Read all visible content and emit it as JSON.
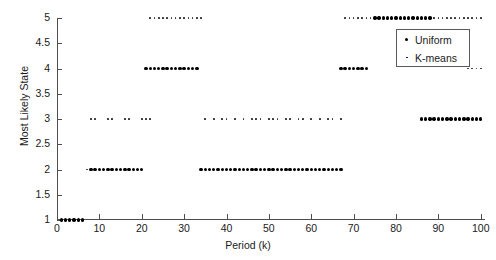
{
  "chart_data": {
    "type": "scatter",
    "title": "",
    "xlabel": "Period (k)",
    "ylabel": "Most Likely State",
    "xlim": [
      0,
      101
    ],
    "ylim": [
      1,
      5
    ],
    "xticks": [
      0,
      10,
      20,
      30,
      40,
      50,
      60,
      70,
      80,
      90,
      100
    ],
    "xtick_labels": [
      "0",
      "10",
      "20",
      "30",
      "40",
      "50",
      "60",
      "70",
      "80",
      "90",
      "100"
    ],
    "yticks": [
      1,
      1.5,
      2,
      2.5,
      3,
      3.5,
      4,
      4.5,
      5
    ],
    "ytick_labels": [
      "1",
      "1.5",
      "2",
      "2.5",
      "3",
      "3.5",
      "4",
      "4.5",
      "5"
    ],
    "grid": false,
    "legend_position": "upper right",
    "legend": [
      {
        "name": "Uniform",
        "marker": "large-dot",
        "color": "#000000"
      },
      {
        "name": "K-means",
        "marker": "small-dot",
        "color": "#2b2b2b"
      }
    ],
    "series": [
      {
        "name": "Uniform",
        "marker": "large-dot",
        "points": [
          [
            1,
            1
          ],
          [
            2,
            1
          ],
          [
            3,
            1
          ],
          [
            4,
            1
          ],
          [
            5,
            1
          ],
          [
            6,
            1
          ],
          [
            8,
            2
          ],
          [
            9,
            2
          ],
          [
            10,
            2
          ],
          [
            11,
            2
          ],
          [
            12,
            2
          ],
          [
            13,
            2
          ],
          [
            14,
            2
          ],
          [
            15,
            2
          ],
          [
            16,
            2
          ],
          [
            17,
            2
          ],
          [
            18,
            2
          ],
          [
            19,
            2
          ],
          [
            20,
            2
          ],
          [
            21,
            4
          ],
          [
            22,
            4
          ],
          [
            23,
            4
          ],
          [
            24,
            4
          ],
          [
            25,
            4
          ],
          [
            26,
            4
          ],
          [
            27,
            4
          ],
          [
            28,
            4
          ],
          [
            29,
            4
          ],
          [
            30,
            4
          ],
          [
            31,
            4
          ],
          [
            32,
            4
          ],
          [
            33,
            4
          ],
          [
            34,
            2
          ],
          [
            35,
            2
          ],
          [
            36,
            2
          ],
          [
            37,
            2
          ],
          [
            38,
            2
          ],
          [
            39,
            2
          ],
          [
            40,
            2
          ],
          [
            41,
            2
          ],
          [
            42,
            2
          ],
          [
            43,
            2
          ],
          [
            44,
            2
          ],
          [
            45,
            2
          ],
          [
            46,
            2
          ],
          [
            47,
            2
          ],
          [
            48,
            2
          ],
          [
            49,
            2
          ],
          [
            50,
            2
          ],
          [
            51,
            2
          ],
          [
            52,
            2
          ],
          [
            53,
            2
          ],
          [
            54,
            2
          ],
          [
            55,
            2
          ],
          [
            56,
            2
          ],
          [
            57,
            2
          ],
          [
            58,
            2
          ],
          [
            59,
            2
          ],
          [
            60,
            2
          ],
          [
            61,
            2
          ],
          [
            62,
            2
          ],
          [
            63,
            2
          ],
          [
            64,
            2
          ],
          [
            65,
            2
          ],
          [
            66,
            2
          ],
          [
            67,
            2
          ],
          [
            67,
            4
          ],
          [
            68,
            4
          ],
          [
            69,
            4
          ],
          [
            70,
            4
          ],
          [
            71,
            4
          ],
          [
            72,
            4
          ],
          [
            73,
            4
          ],
          [
            75,
            5
          ],
          [
            76,
            5
          ],
          [
            77,
            5
          ],
          [
            78,
            5
          ],
          [
            79,
            5
          ],
          [
            80,
            5
          ],
          [
            81,
            5
          ],
          [
            82,
            5
          ],
          [
            83,
            5
          ],
          [
            84,
            5
          ],
          [
            85,
            5
          ],
          [
            86,
            5
          ],
          [
            87,
            5
          ],
          [
            88,
            5
          ],
          [
            86,
            3
          ],
          [
            87,
            3
          ],
          [
            88,
            3
          ],
          [
            89,
            3
          ],
          [
            90,
            3
          ],
          [
            91,
            3
          ],
          [
            92,
            3
          ],
          [
            93,
            3
          ],
          [
            94,
            3
          ],
          [
            95,
            3
          ],
          [
            96,
            3
          ],
          [
            97,
            3
          ],
          [
            98,
            3
          ],
          [
            99,
            3
          ],
          [
            100,
            3
          ]
        ]
      },
      {
        "name": "K-means",
        "marker": "small-dot",
        "points": [
          [
            7,
            2
          ],
          [
            8,
            3
          ],
          [
            9,
            3
          ],
          [
            12,
            3
          ],
          [
            13,
            3
          ],
          [
            16,
            3
          ],
          [
            17,
            3
          ],
          [
            20,
            3
          ],
          [
            21,
            3
          ],
          [
            22,
            3
          ],
          [
            22,
            5
          ],
          [
            23,
            5
          ],
          [
            24,
            5
          ],
          [
            25,
            5
          ],
          [
            26,
            5
          ],
          [
            27,
            5
          ],
          [
            28,
            5
          ],
          [
            29,
            5
          ],
          [
            30,
            5
          ],
          [
            31,
            5
          ],
          [
            32,
            5
          ],
          [
            33,
            5
          ],
          [
            34,
            5
          ],
          [
            35,
            3
          ],
          [
            37,
            3
          ],
          [
            39,
            3
          ],
          [
            40,
            3
          ],
          [
            42,
            3
          ],
          [
            44,
            3
          ],
          [
            46,
            3
          ],
          [
            47,
            3
          ],
          [
            48,
            3
          ],
          [
            50,
            3
          ],
          [
            51,
            3
          ],
          [
            52,
            3
          ],
          [
            54,
            3
          ],
          [
            55,
            3
          ],
          [
            57,
            3
          ],
          [
            58,
            3
          ],
          [
            60,
            3
          ],
          [
            62,
            3
          ],
          [
            64,
            3
          ],
          [
            65,
            3
          ],
          [
            67,
            3
          ],
          [
            68,
            5
          ],
          [
            69,
            5
          ],
          [
            70,
            5
          ],
          [
            71,
            5
          ],
          [
            72,
            5
          ],
          [
            73,
            5
          ],
          [
            74,
            5
          ],
          [
            89,
            5
          ],
          [
            90,
            5
          ],
          [
            91,
            5
          ],
          [
            92,
            5
          ],
          [
            93,
            5
          ],
          [
            94,
            5
          ],
          [
            95,
            5
          ],
          [
            96,
            5
          ],
          [
            97,
            5
          ],
          [
            98,
            5
          ],
          [
            99,
            5
          ],
          [
            100,
            5
          ],
          [
            97,
            4
          ],
          [
            98,
            4
          ],
          [
            99,
            4
          ],
          [
            100,
            4
          ]
        ]
      }
    ]
  }
}
